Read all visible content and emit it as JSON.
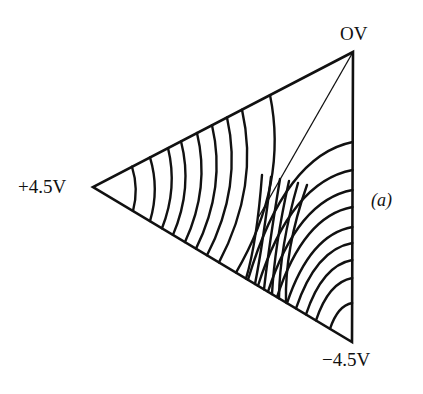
{
  "figure": {
    "type": "equipotential-diagram",
    "shape": "triangle",
    "panel_label": "(a)",
    "vertices": {
      "top": {
        "label": "OV",
        "x": 353,
        "y": 52
      },
      "left": {
        "label": "+4.5V",
        "x": 93,
        "y": 187
      },
      "bottom": {
        "label": "−4.5V",
        "x": 352,
        "y": 342
      }
    },
    "colors": {
      "line": "#111111",
      "background": "#ffffff"
    },
    "left_family_count": 9,
    "middle_family_count": 9,
    "right_family_count": 9
  }
}
